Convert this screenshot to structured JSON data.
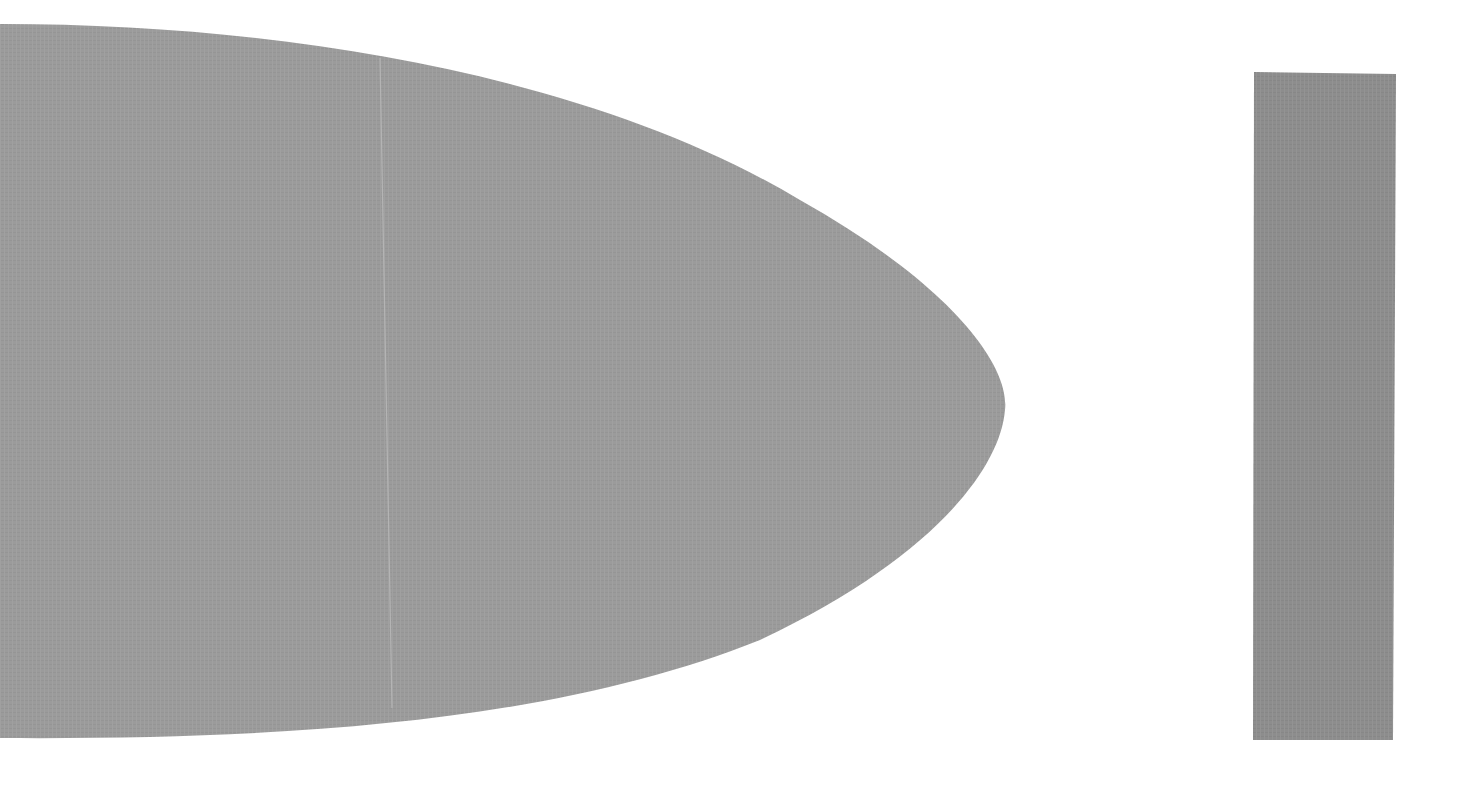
{
  "canvas": {
    "width": 1469,
    "height": 808,
    "background": "#ffffff"
  },
  "shapes": {
    "half_ellipse": {
      "fill": "#9a9a9a",
      "seam_color": "#b0b0b0"
    },
    "rectangle": {
      "fill": "#8c8c8c"
    }
  }
}
